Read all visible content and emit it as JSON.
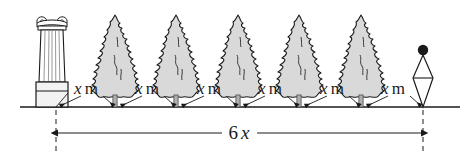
{
  "figure": {
    "background_color": "#ffffff",
    "ink_color": "#1a1a1a",
    "foliage_fill": "#d9d9d9",
    "trunk_fill": "#b0b0b0",
    "base_fill": "#f2f2f2"
  },
  "ground": {
    "name": "ground-line",
    "y": 107,
    "x_start": 20,
    "x_end": 460
  },
  "column": {
    "name": "ionic-column",
    "x": 52,
    "capital_label": "volute-capital",
    "base_label": "column-base"
  },
  "post": {
    "name": "lamp-post",
    "x": 423,
    "finial_label": "sphere-finial"
  },
  "trees": [
    {
      "name": "tree-1",
      "x": 115
    },
    {
      "name": "tree-2",
      "x": 176
    },
    {
      "name": "tree-3",
      "x": 238
    },
    {
      "name": "tree-4",
      "x": 299
    },
    {
      "name": "tree-5",
      "x": 361
    }
  ],
  "spacing_labels": [
    {
      "variable": "x",
      "unit": "m",
      "x": 86,
      "y": 94
    },
    {
      "variable": "x",
      "unit": "m",
      "x": 147,
      "y": 94
    },
    {
      "variable": "x",
      "unit": "m",
      "x": 209,
      "y": 94
    },
    {
      "variable": "x",
      "unit": "m",
      "x": 270,
      "y": 94
    },
    {
      "variable": "x",
      "unit": "m",
      "x": 332,
      "y": 94
    },
    {
      "variable": "x",
      "unit": "m",
      "x": 393,
      "y": 94
    }
  ],
  "dimension": {
    "name": "total-span-dimension",
    "coefficient": "6",
    "variable": "x",
    "label_x": 239,
    "label_y": 138,
    "line_y": 133,
    "x_start": 55,
    "x_end": 423,
    "extension_top": 110,
    "extension_bottom": 152
  }
}
